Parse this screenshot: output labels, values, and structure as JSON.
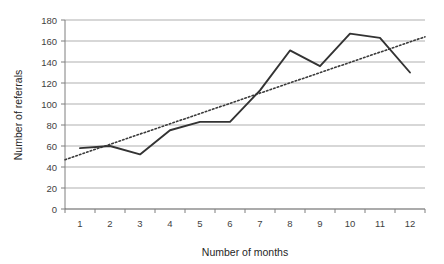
{
  "chart_data": {
    "type": "line",
    "title": "",
    "xlabel": "Number of months",
    "ylabel": "Number of referrals",
    "categories": [
      "1",
      "2",
      "3",
      "4",
      "5",
      "6",
      "7",
      "8",
      "9",
      "10",
      "11",
      "12"
    ],
    "x": [
      1,
      2,
      3,
      4,
      5,
      6,
      7,
      8,
      9,
      10,
      11,
      12
    ],
    "series": [
      {
        "name": "Number of referrals",
        "type": "line",
        "style": "solid",
        "color": "#333333",
        "values": [
          58,
          60,
          52,
          75,
          83,
          83,
          113,
          151,
          136,
          167,
          163,
          130
        ]
      },
      {
        "name": "Linear trendline",
        "type": "line",
        "style": "dotted",
        "color": "#3a3a3a",
        "endpoints": [
          47,
          164
        ],
        "values": [
          52,
          63,
          73,
          84,
          94,
          105,
          116,
          126,
          137,
          147,
          158,
          164
        ]
      }
    ],
    "ylim": [
      0,
      180
    ],
    "ytick_step": 20,
    "yticks": [
      0,
      20,
      40,
      60,
      80,
      100,
      120,
      140,
      160,
      180
    ],
    "ytick_labels": [
      "0",
      "20",
      "40",
      "60",
      "80",
      "100",
      "120",
      "140",
      "160",
      "180"
    ],
    "xlim": [
      0,
      12
    ],
    "grid": "horizontal",
    "grid_color": "#a6a6a6",
    "legend": "none",
    "legend_position": "none",
    "annotations": []
  },
  "axis": {
    "x_title": "Number of months",
    "y_title": "Number of referrals"
  }
}
